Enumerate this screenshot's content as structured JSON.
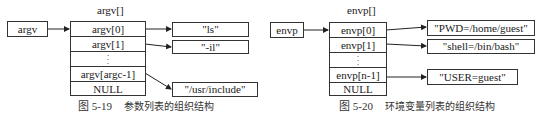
{
  "argv_diagram": {
    "pointer_label": "argv",
    "array_label": "argv[]",
    "cells": [
      "argv[0]",
      "argv[1]",
      "⋮",
      "argv[argc-1]",
      "NULL"
    ],
    "targets": [
      "\"ls\"",
      "\"-il\"",
      "\"/usr/include\""
    ],
    "caption_number": "图 5-19",
    "caption_text": "参数列表的组织结构"
  },
  "envp_diagram": {
    "pointer_label": "envp",
    "array_label": "envp[]",
    "cells": [
      "envp[0]",
      "envp[1]",
      "⋮",
      "envp[n-1]",
      "NULL"
    ],
    "targets": [
      "\"PWD=/home/guest\"",
      "\"shell=/bin/bash\"",
      "\"USER=guest\""
    ],
    "caption_number": "图 5-20",
    "caption_text": "环境变量列表的组织结构"
  }
}
